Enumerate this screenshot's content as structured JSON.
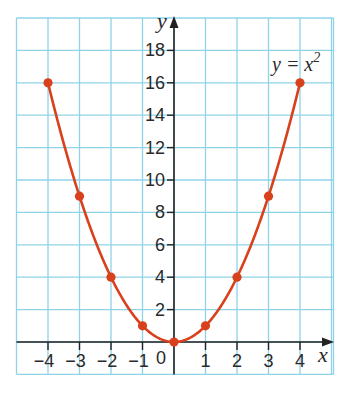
{
  "chart_data": {
    "type": "line",
    "title": "",
    "annotation": "y = x²",
    "annotation_parts": {
      "lhs": "y = x",
      "exp": "2"
    },
    "xlabel": "x",
    "ylabel": "y",
    "x": [
      -4,
      -3,
      -2,
      -1,
      0,
      1,
      2,
      3,
      4
    ],
    "series": [
      {
        "name": "y = x²",
        "values": [
          16,
          9,
          4,
          1,
          0,
          1,
          4,
          9,
          16
        ],
        "color": "#d9401c",
        "markers": true,
        "smooth": true
      }
    ],
    "xticks": [
      "−4",
      "−3",
      "−2",
      "−1",
      "0",
      "1",
      "2",
      "3",
      "4"
    ],
    "yticks": [
      "2",
      "4",
      "6",
      "8",
      "10",
      "12",
      "14",
      "16",
      "18"
    ],
    "xlim": [
      -5,
      5
    ],
    "ylim": [
      -2,
      20
    ],
    "grid": true,
    "grid_color": "#8fd3e8",
    "axis_color": "#222222",
    "legend": "none"
  }
}
